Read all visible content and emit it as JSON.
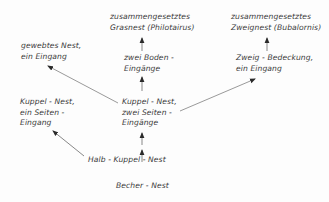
{
  "diagram": {
    "type": "flow",
    "nodes": {
      "woven": {
        "line1": "gewebtes Nest,",
        "line2": "ein Eingang"
      },
      "grass_compound": {
        "line1": "zusammengesetztes",
        "line2": "Grasnest (Philotairus)"
      },
      "twig_compound": {
        "line1": "zusammengesetztes",
        "line2": "Zweignest (Bubalornis)"
      },
      "two_floor": {
        "line1": "zwei Boden -",
        "line2": "Eingänge"
      },
      "twig_cover": {
        "line1": "Zweig - Bedeckung,",
        "line2": "ein Eingang"
      },
      "dome_one_side": {
        "line1": "Kuppel - Nest,",
        "line2": "ein Seiten -",
        "line3": "Eingang"
      },
      "dome_two_side": {
        "line1": "Kuppel - Nest,",
        "line2": "zwei Seiten -",
        "line3": "Eingänge"
      },
      "half_dome": {
        "line1": "Halb - Kuppel - Nest"
      },
      "cup": {
        "line1": "Becher - Nest"
      }
    },
    "edges": [
      {
        "from": "cup",
        "to": "half_dome"
      },
      {
        "from": "half_dome",
        "to": "dome_one_side"
      },
      {
        "from": "half_dome",
        "to": "dome_two_side"
      },
      {
        "from": "dome_two_side",
        "to": "woven"
      },
      {
        "from": "dome_two_side",
        "to": "two_floor"
      },
      {
        "from": "dome_two_side",
        "to": "twig_cover"
      },
      {
        "from": "two_floor",
        "to": "grass_compound"
      },
      {
        "from": "twig_cover",
        "to": "twig_compound"
      }
    ],
    "colors": {
      "ink": "#3a3a3a",
      "background": "#fdfdfd"
    }
  }
}
